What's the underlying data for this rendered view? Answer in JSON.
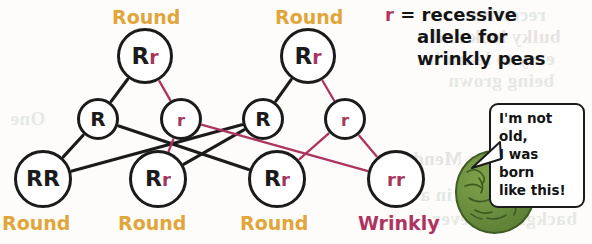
{
  "diagram": {
    "title_semantic": "pea-plant-inheritance-pedigree",
    "colors": {
      "dominant_allele": "#1b1b1b",
      "recessive_allele": "#a6355c",
      "round_label": "#e0a63c",
      "wrinkly_label": "#ad3360",
      "dominant_line": "#1b1b1b",
      "recessive_line": "#ad3360",
      "pea_body": "#6c9040"
    },
    "top_labels": [
      {
        "text": "Round",
        "x": 112,
        "y": 6
      },
      {
        "text": "Round",
        "x": 275,
        "y": 6
      }
    ],
    "bottom_labels": [
      {
        "text": "Round",
        "x": 2,
        "y": 212,
        "kind": "round"
      },
      {
        "text": "Round",
        "x": 118,
        "y": 212,
        "kind": "round"
      },
      {
        "text": "Round",
        "x": 240,
        "y": 212,
        "kind": "round"
      },
      {
        "text": "Wrinkly",
        "x": 358,
        "y": 212,
        "kind": "wrinkly"
      }
    ],
    "nodes": [
      {
        "id": "p1",
        "alleles": "Rr",
        "cx": 145,
        "cy": 56,
        "r": 28,
        "font": 23
      },
      {
        "id": "p2",
        "alleles": "Rr",
        "cx": 308,
        "cy": 56,
        "r": 28,
        "font": 23
      },
      {
        "id": "g1",
        "alleles": "R",
        "cx": 98,
        "cy": 119,
        "r": 21,
        "font": 20
      },
      {
        "id": "g2",
        "alleles": "r",
        "cx": 181,
        "cy": 119,
        "r": 21,
        "font": 20
      },
      {
        "id": "g3",
        "alleles": "R",
        "cx": 263,
        "cy": 119,
        "r": 21,
        "font": 20
      },
      {
        "id": "g4",
        "alleles": "r",
        "cx": 345,
        "cy": 119,
        "r": 21,
        "font": 20
      },
      {
        "id": "o1",
        "alleles": "RR",
        "cx": 43,
        "cy": 179,
        "r": 29,
        "font": 22
      },
      {
        "id": "o2",
        "alleles": "Rr",
        "cx": 158,
        "cy": 179,
        "r": 29,
        "font": 22
      },
      {
        "id": "o3",
        "alleles": "Rr",
        "cx": 277,
        "cy": 179,
        "r": 29,
        "font": 22
      },
      {
        "id": "o4",
        "alleles": "rr",
        "cx": 396,
        "cy": 179,
        "r": 29,
        "font": 22
      }
    ],
    "edges": [
      {
        "from": "p1",
        "to": "g1",
        "type": "dominant"
      },
      {
        "from": "p1",
        "to": "g2",
        "type": "recessive"
      },
      {
        "from": "p2",
        "to": "g3",
        "type": "dominant"
      },
      {
        "from": "p2",
        "to": "g4",
        "type": "recessive"
      },
      {
        "from": "g1",
        "to": "o1",
        "type": "dominant"
      },
      {
        "from": "g1",
        "to": "o3",
        "type": "dominant"
      },
      {
        "from": "g3",
        "to": "o1",
        "type": "dominant"
      },
      {
        "from": "g3",
        "to": "o2",
        "type": "dominant"
      },
      {
        "from": "g2",
        "to": "o2",
        "type": "recessive"
      },
      {
        "from": "g2",
        "to": "o4",
        "type": "recessive"
      },
      {
        "from": "g4",
        "to": "o3",
        "type": "recessive"
      },
      {
        "from": "g4",
        "to": "o4",
        "type": "recessive"
      }
    ]
  },
  "legend": {
    "symbol": "r",
    "equals": "=",
    "line1": "recessive",
    "line2": "allele for",
    "line3": "wrinkly peas"
  },
  "speech_bubble": {
    "line1": "I'm not old,",
    "line2": "I was born",
    "line3": "like this!"
  },
  "character": {
    "name": "wrinkly-pea"
  },
  "background_bleed": [
    {
      "text": "recessive",
      "x": 470,
      "y": 4,
      "variant": "b1"
    },
    {
      "text": "bulky look and",
      "x": 432,
      "y": 26,
      "variant": "b2"
    },
    {
      "text": "easy to learn it",
      "x": 428,
      "y": 48,
      "variant": "b1"
    },
    {
      "text": "being grown",
      "x": 448,
      "y": 70,
      "variant": "b3"
    },
    {
      "text": "One",
      "x": 10,
      "y": 108,
      "variant": "b3"
    },
    {
      "text": "to Mendel",
      "x": 398,
      "y": 148,
      "variant": "b2"
    },
    {
      "text": "day in a",
      "x": 420,
      "y": 184,
      "variant": "b1"
    },
    {
      "text": "background ever",
      "x": 432,
      "y": 208,
      "variant": "b3"
    }
  ]
}
